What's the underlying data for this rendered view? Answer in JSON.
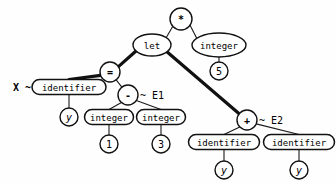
{
  "diagram": {
    "background_color": "#fefefe",
    "line_color": "#111111"
  },
  "nodes": {
    "root_mul": {
      "label": "*",
      "shape": "circle",
      "x": 181,
      "y": 19,
      "r": 11
    },
    "let": {
      "label": "let",
      "shape": "ellipse",
      "x": 152,
      "y": 45,
      "rx": 19,
      "ry": 11
    },
    "integer_top": {
      "label": "integer",
      "shape": "ellipse",
      "x": 219,
      "y": 45,
      "rx": 27,
      "ry": 12
    },
    "five": {
      "label": "5",
      "shape": "circle",
      "x": 219,
      "y": 71,
      "r": 9
    },
    "eq": {
      "label": "=",
      "shape": "circle",
      "x": 110,
      "y": 72,
      "r": 10
    },
    "identifier_x": {
      "label": "identifier",
      "shape": "box",
      "x": 69,
      "y": 87,
      "w": 74,
      "h": 15
    },
    "y_x": {
      "label": "y",
      "shape": "circle",
      "x": 69,
      "y": 117,
      "r": 9
    },
    "minus": {
      "label": "-",
      "shape": "circle",
      "x": 128,
      "y": 95,
      "r": 10
    },
    "integer_1": {
      "label": "integer",
      "shape": "box",
      "x": 109,
      "y": 117,
      "w": 49,
      "h": 15
    },
    "one": {
      "label": "1",
      "shape": "circle",
      "x": 109,
      "y": 144,
      "r": 9
    },
    "integer_3": {
      "label": "integer",
      "shape": "box",
      "x": 161,
      "y": 117,
      "w": 49,
      "h": 15
    },
    "three": {
      "label": "3",
      "shape": "circle",
      "x": 161,
      "y": 144,
      "r": 9
    },
    "plus": {
      "label": "+",
      "shape": "circle",
      "x": 247,
      "y": 120,
      "r": 10
    },
    "identifier_y1": {
      "label": "identifier",
      "shape": "box",
      "x": 224,
      "y": 142,
      "w": 71,
      "h": 15
    },
    "y_1": {
      "label": "y",
      "shape": "circle",
      "x": 224,
      "y": 170,
      "r": 9
    },
    "identifier_y2": {
      "label": "identifier",
      "shape": "box",
      "x": 299,
      "y": 142,
      "w": 71,
      "h": 15
    },
    "y_2": {
      "label": "y",
      "shape": "circle",
      "x": 299,
      "y": 170,
      "r": 9
    }
  },
  "annotations": {
    "bind_x": {
      "text": "X ~",
      "x": 15,
      "y": 87
    },
    "label_e1": {
      "text": "~ E1",
      "x": 140,
      "y": 95
    },
    "label_e2": {
      "text": "~ E2",
      "x": 259,
      "y": 120
    }
  },
  "edges": [
    {
      "from": "root_mul",
      "to": "let",
      "weight": "thin"
    },
    {
      "from": "root_mul",
      "to": "integer_top",
      "weight": "thin"
    },
    {
      "from": "integer_top",
      "to": "five",
      "weight": "thin"
    },
    {
      "from": "let",
      "to": "eq",
      "weight": "thick"
    },
    {
      "from": "let",
      "to": "plus",
      "weight": "thick"
    },
    {
      "from": "eq",
      "to": "identifier_x",
      "weight": "thick"
    },
    {
      "from": "eq",
      "to": "minus",
      "weight": "thin"
    },
    {
      "from": "identifier_x",
      "to": "y_x",
      "weight": "thin"
    },
    {
      "from": "minus",
      "to": "integer_1",
      "weight": "thin"
    },
    {
      "from": "minus",
      "to": "integer_3",
      "weight": "thin"
    },
    {
      "from": "integer_1",
      "to": "one",
      "weight": "thin"
    },
    {
      "from": "integer_3",
      "to": "three",
      "weight": "thin"
    },
    {
      "from": "plus",
      "to": "identifier_y1",
      "weight": "thin"
    },
    {
      "from": "plus",
      "to": "identifier_y2",
      "weight": "thin"
    },
    {
      "from": "identifier_y1",
      "to": "y_1",
      "weight": "thin"
    },
    {
      "from": "identifier_y2",
      "to": "y_2",
      "weight": "thin"
    }
  ]
}
